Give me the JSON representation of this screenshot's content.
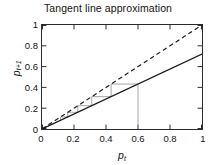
{
  "chart_data": {
    "type": "line",
    "title": "Tangent line approximation",
    "xlabel": "p_t",
    "ylabel": "p_{t+1}",
    "xlim": [
      0,
      1
    ],
    "ylim": [
      0,
      1
    ],
    "xticks": [
      0,
      0.2,
      0.4,
      0.6,
      0.8,
      1
    ],
    "yticks": [
      0,
      0.2,
      0.4,
      0.6,
      0.8,
      1
    ],
    "xtick_labels": [
      "0",
      "0.2",
      "0.4",
      "0.6",
      "0.8",
      "1"
    ],
    "ytick_labels": [
      "0",
      "0.2",
      "0.4",
      "0.6",
      "0.8",
      "1"
    ],
    "grid": false,
    "legend": "none",
    "series": [
      {
        "name": "identity-line",
        "style": "dashed",
        "color": "#1a1a1a",
        "x": [
          0,
          1
        ],
        "values": [
          0,
          1
        ]
      },
      {
        "name": "tangent-line",
        "style": "solid",
        "color": "#1a1a1a",
        "slope": 0.72,
        "x": [
          0,
          1
        ],
        "values": [
          0,
          0.72
        ]
      },
      {
        "name": "cobweb-trajectory",
        "style": "solid-thin",
        "color": "#9a9a9a",
        "start_x": 0.6,
        "points_x": [
          0.6,
          0.6,
          0.432,
          0.432,
          0.311,
          0.311,
          0.224,
          0.224,
          0.161,
          0.161,
          0.116,
          0.116
        ],
        "points_y": [
          0.0,
          0.432,
          0.432,
          0.311,
          0.311,
          0.224,
          0.224,
          0.161,
          0.161,
          0.116,
          0.116,
          0.084
        ]
      }
    ]
  },
  "axis_labels": {
    "y_base": "p",
    "y_sub": "t+1",
    "x_base": "p",
    "x_sub": "t"
  },
  "colors": {
    "axis": "#2b2b2b",
    "line": "#1a1a1a",
    "cobweb": "#9a9a9a",
    "background": "#ffffff"
  }
}
